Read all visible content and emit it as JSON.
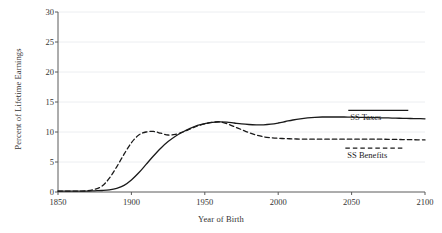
{
  "chart_data": {
    "type": "line",
    "title": "",
    "subtitle": "",
    "xlabel": "Year of Birth",
    "ylabel": "Percent of Lifetime Earnings",
    "xlim": [
      1850,
      2100
    ],
    "ylim": [
      0,
      30
    ],
    "xticks": [
      "1850",
      "1900",
      "1950",
      "2000",
      "2050",
      "2100"
    ],
    "yticks": [
      "0",
      "5",
      "10",
      "15",
      "20",
      "25",
      "30"
    ],
    "grid": "horizontal",
    "legend_position": "inline-right",
    "x": [
      1850,
      1860,
      1865,
      1870,
      1875,
      1880,
      1885,
      1890,
      1895,
      1900,
      1905,
      1910,
      1915,
      1920,
      1925,
      1930,
      1935,
      1940,
      1945,
      1950,
      1955,
      1960,
      1965,
      1970,
      1975,
      1980,
      1985,
      1990,
      1995,
      2000,
      2005,
      2010,
      2015,
      2020,
      2025,
      2030,
      2035,
      2040,
      2045,
      2050,
      2055,
      2060,
      2065,
      2070,
      2075,
      2080,
      2085,
      2090,
      2095,
      2100
    ],
    "series": [
      {
        "name": "SS Taxes",
        "style": "solid",
        "color": "#1a1a1a",
        "values": [
          0.15,
          0.15,
          0.15,
          0.15,
          0.2,
          0.25,
          0.35,
          0.6,
          1.1,
          2.0,
          3.2,
          4.6,
          6.0,
          7.3,
          8.4,
          9.3,
          10.0,
          10.6,
          11.1,
          11.4,
          11.6,
          11.7,
          11.65,
          11.5,
          11.35,
          11.25,
          11.2,
          11.2,
          11.3,
          11.5,
          11.75,
          12.0,
          12.2,
          12.35,
          12.45,
          12.5,
          12.5,
          12.5,
          12.5,
          12.48,
          12.45,
          12.42,
          12.4,
          12.37,
          12.34,
          12.3,
          12.28,
          12.25,
          12.23,
          12.2
        ]
      },
      {
        "name": "SS Benefits",
        "style": "dashed",
        "color": "#1a1a1a",
        "values": [
          0.15,
          0.15,
          0.15,
          0.2,
          0.45,
          1.0,
          2.3,
          4.2,
          6.3,
          8.2,
          9.5,
          10.0,
          10.1,
          9.8,
          9.5,
          9.6,
          10.0,
          10.5,
          11.0,
          11.35,
          11.6,
          11.7,
          11.4,
          10.9,
          10.4,
          9.9,
          9.5,
          9.2,
          9.05,
          8.95,
          8.9,
          8.85,
          8.82,
          8.8,
          8.8,
          8.8,
          8.8,
          8.8,
          8.8,
          8.8,
          8.8,
          8.8,
          8.8,
          8.8,
          8.78,
          8.76,
          8.74,
          8.72,
          8.7,
          8.68
        ]
      }
    ],
    "annotations": [
      {
        "text": "SS Taxes",
        "x": 2060,
        "y": 13.6
      },
      {
        "text": "SS Benefits",
        "x": 2058,
        "y": 7.3
      }
    ]
  },
  "colors": {
    "axis": "#5a5a5a",
    "grid": "#eceef1",
    "text": "#333333",
    "line": "#1a1a1a",
    "background": "#ffffff"
  }
}
